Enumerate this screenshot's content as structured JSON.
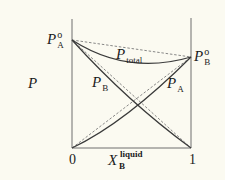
{
  "diagram": {
    "title": "",
    "y_axis_label": "P",
    "x_axis_label": {
      "base": "X",
      "subscript": "B",
      "superscript": "liquid"
    },
    "x_ticks": [
      "0",
      "1"
    ],
    "endpoint_labels": {
      "left": {
        "base": "P",
        "subscript": "A",
        "superscript": "o"
      },
      "right": {
        "base": "P",
        "subscript": "B",
        "superscript": "o"
      }
    },
    "curve_labels": {
      "total": {
        "base": "P",
        "subscript": "total"
      },
      "pb": {
        "base": "P",
        "subscript": "B"
      },
      "pa": {
        "base": "P",
        "subscript": "A"
      }
    },
    "colors": {
      "background": "#fbfaf1",
      "axis": "#6e6e6e",
      "solid_curve": "#3a3a3a",
      "dashed_line": "#7a7a7a",
      "text": "#1c1c1c"
    },
    "legend_notes": {
      "dashed": "Raoult's law (ideal) lines",
      "solid": "actual vapor pressure curves (negative deviation)"
    }
  }
}
